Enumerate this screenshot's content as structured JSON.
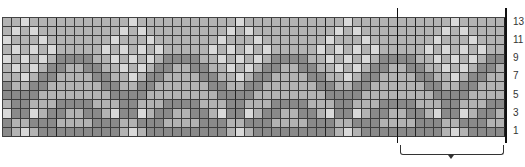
{
  "chart_data": {
    "type": "heatmap",
    "title": "",
    "columns": 56,
    "rows": 13,
    "row_labels": [
      "1",
      "3",
      "5",
      "7",
      "9",
      "11",
      "13"
    ],
    "repeat": {
      "width": 12,
      "start_column": 45,
      "end_column": 56,
      "bracket": true
    },
    "legend": {
      "L": "light",
      "M": "medium",
      "D": "dark"
    },
    "colors": {
      "L": "#d9d9d9",
      "M": "#b3b3b3",
      "D": "#8a8a8a"
    },
    "repeat_rows_top_to_bottom": [
      {
        "row": 13,
        "cells": "MMMMMMLMMMMM"
      },
      {
        "row": 12,
        "cells": "MMMMMLMLMMMM"
      },
      {
        "row": 11,
        "cells": "MMMMLMMMLMMM"
      },
      {
        "row": 10,
        "cells": "MMMLMLMLMLMM"
      },
      {
        "row": 9,
        "cells": "DDMMLMLMLMDD"
      },
      {
        "row": 8,
        "cells": "MDDMMLMLMDDM"
      },
      {
        "row": 7,
        "cells": "MMDDMMLMDDMM"
      },
      {
        "row": 6,
        "cells": "MMMDDMMDDMMM"
      },
      {
        "row": 5,
        "cells": "MMMMDDDDMMMM"
      },
      {
        "row": 4,
        "cells": "DDMMMDDMMMDD"
      },
      {
        "row": 3,
        "cells": "MDDMLDDLMDDM"
      },
      {
        "row": 2,
        "cells": "MMDDDMMDDDMM"
      },
      {
        "row": 1,
        "cells": "DDDDDMLMDDDD"
      }
    ]
  }
}
